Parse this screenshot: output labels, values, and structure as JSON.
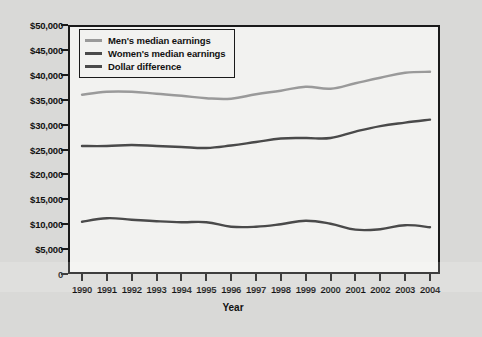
{
  "figure": {
    "background_color": "#d9d9d7",
    "plot_background_color": "#f2f2f0",
    "frame_color": "#1a1a1a"
  },
  "chart_data": {
    "type": "line",
    "title": "",
    "xlabel": "Year",
    "ylabel": "",
    "grid": false,
    "legend_position": "top-left",
    "x": [
      1990,
      1991,
      1992,
      1993,
      1994,
      1995,
      1996,
      1997,
      1998,
      1999,
      2000,
      2001,
      2002,
      2003,
      2004
    ],
    "categories": [
      "1990",
      "1991",
      "1992",
      "1993",
      "1994",
      "1995",
      "1996",
      "1997",
      "1998",
      "1999",
      "2000",
      "2001",
      "2002",
      "2003",
      "2004"
    ],
    "ylim": [
      0,
      50000
    ],
    "ytick_labels": [
      "$50,000",
      "$45,000",
      "$40,000",
      "$35,000",
      "$30,000",
      "$25,000",
      "$20,000",
      "$15,000",
      "$10,000",
      "$5,000",
      "0"
    ],
    "ytick_values": [
      50000,
      45000,
      40000,
      35000,
      30000,
      25000,
      20000,
      15000,
      10000,
      5000,
      0
    ],
    "series": [
      {
        "name": "Men's median earnings",
        "color": "#9a9a9a",
        "values": [
          36000,
          36600,
          36600,
          36200,
          35800,
          35300,
          35200,
          36100,
          36800,
          37600,
          37200,
          38300,
          39400,
          40400,
          40600
        ]
      },
      {
        "name": "Women's median earnings",
        "color": "#4a4a4a",
        "values": [
          25700,
          25700,
          25900,
          25700,
          25500,
          25300,
          25800,
          26500,
          27200,
          27300,
          27300,
          28600,
          29700,
          30400,
          31000
        ]
      },
      {
        "name": "Dollar difference",
        "color": "#4a4a4a",
        "values": [
          10500,
          11200,
          10900,
          10600,
          10400,
          10400,
          9500,
          9500,
          10000,
          10700,
          10100,
          8900,
          9000,
          9800,
          9400
        ]
      }
    ]
  },
  "legend": {
    "items": [
      {
        "label": "Men's median earnings",
        "color": "#9a9a9a"
      },
      {
        "label": "Women's median earnings",
        "color": "#4a4a4a"
      },
      {
        "label": "Dollar difference",
        "color": "#4a4a4a"
      }
    ]
  },
  "axes": {
    "x_title": "Year"
  }
}
